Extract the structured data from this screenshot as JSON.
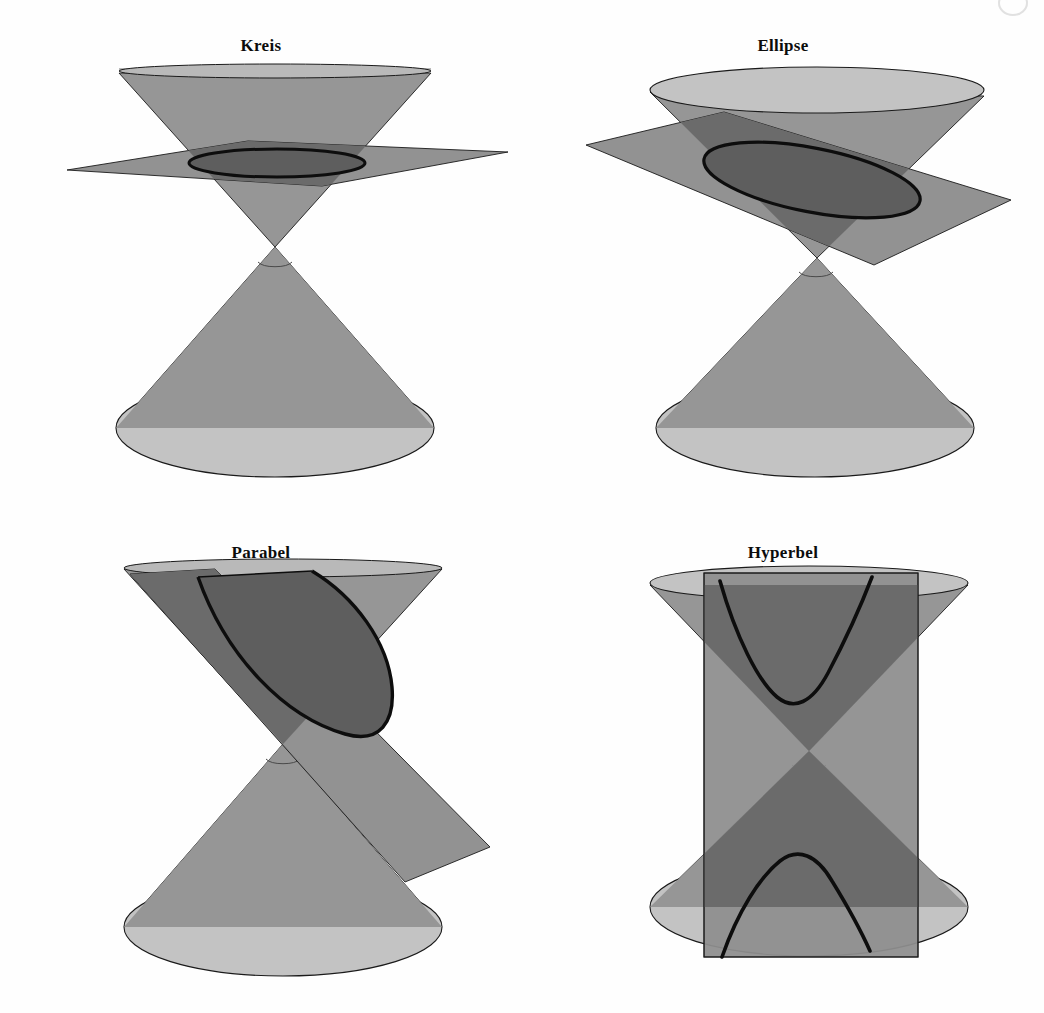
{
  "figure": {
    "background_color": "#fefefe",
    "panels": [
      {
        "id": "kreis",
        "label": "Kreis",
        "section_type": "circle",
        "description": "Horizontale Schnittebene senkrecht zur Kegelachse schneidet den oberen Kegel in einem Kreis.",
        "plane_orientation": "horizontal",
        "intersects": "upper-nappe"
      },
      {
        "id": "ellipse",
        "label": "Ellipse",
        "section_type": "ellipse",
        "description": "Geneigte Schnittebene schneidet alle Mantellinien des oberen Kegels in einer Ellipse.",
        "plane_orientation": "tilted-shallow",
        "intersects": "upper-nappe"
      },
      {
        "id": "parabel",
        "label": "Parabel",
        "section_type": "parabola",
        "description": "Schnittebene parallel zu einer Mantellinie erzeugt eine Parabel.",
        "plane_orientation": "tilted-parallel-to-generator",
        "intersects": "upper-nappe"
      },
      {
        "id": "hyperbel",
        "label": "Hyperbel",
        "section_type": "hyperbola",
        "description": "Vertikale Schnittebene schneidet beide Kegelhaelften und erzeugt eine Hyperbel mit zwei Aesten.",
        "plane_orientation": "vertical",
        "intersects": "both-nappes"
      }
    ],
    "colors": {
      "background": "#fefefe",
      "cone_body": "#969696",
      "cone_cap_light": "#c3c3c3",
      "cone_cap_top": "#b9b9b9",
      "plane_fill": "#8e8e8e",
      "plane_over_cone": "#6b6b6b",
      "section_interior": "#5e5e5e",
      "outline": "#1a1a1a",
      "curve_stroke": "#0d0d0d",
      "title_text": "#0c0c0c"
    }
  }
}
